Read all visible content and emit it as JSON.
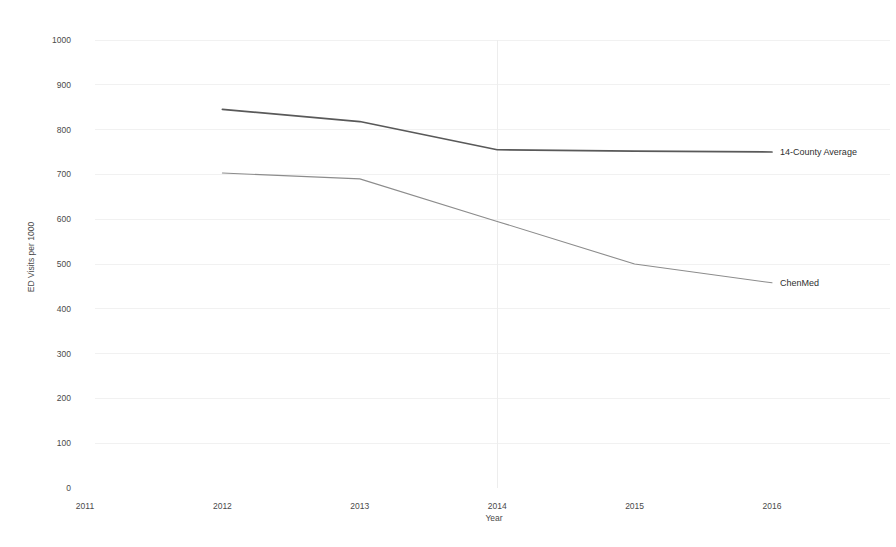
{
  "chart_data": {
    "type": "line",
    "title": "",
    "xlabel": "Year",
    "ylabel": "ED Visits per 1000",
    "x": [
      2011,
      2012,
      2013,
      2014,
      2015,
      2016
    ],
    "xlim": [
      2011,
      2016
    ],
    "ylim": [
      0,
      1000
    ],
    "ytick_step": 100,
    "xticks": [
      "2011",
      "2012",
      "2013",
      "2014",
      "2015",
      "2016"
    ],
    "yticks": [
      "0",
      "100",
      "200",
      "300",
      "400",
      "500",
      "600",
      "700",
      "800",
      "900",
      "1000"
    ],
    "grid": "faint horizontal gridlines plus one faint vertical line at 2014",
    "legend_position": "inline end-of-line labels at right",
    "series": [
      {
        "name": "14-County Average",
        "label": "14-County Average",
        "color": "#595959",
        "x": [
          2012,
          2013,
          2014,
          2015,
          2016
        ],
        "values": [
          845,
          818,
          755,
          752,
          750
        ]
      },
      {
        "name": "ChenMed",
        "label": "ChenMed",
        "color": "#8c8c8c",
        "x": [
          2012,
          2013,
          2014,
          2015,
          2016
        ],
        "values": [
          703,
          690,
          595,
          500,
          458
        ]
      }
    ]
  },
  "labels": {
    "series_top": "14-County Average",
    "series_bottom": "ChenMed",
    "y_axis_title": "ED Visits per 1000",
    "x_axis_title": "Year"
  }
}
